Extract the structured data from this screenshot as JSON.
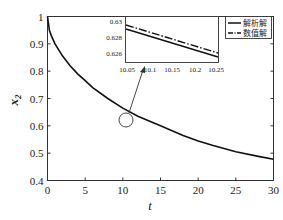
{
  "chart_data": {
    "type": "line",
    "title": "",
    "xlabel": "t",
    "ylabel": "x2",
    "xlim": [
      0,
      30
    ],
    "ylim": [
      0.4,
      1.0
    ],
    "xticks": [
      0,
      5,
      10,
      15,
      20,
      25,
      30
    ],
    "yticks": [
      0.4,
      0.5,
      0.6,
      0.7,
      0.8,
      0.9,
      1.0
    ],
    "ytick_labels": [
      "0.4",
      "0.5",
      "0.6",
      "0.7",
      "0.8",
      "0.9",
      "1"
    ],
    "grid": false,
    "legend_position": "upper right",
    "series": [
      {
        "name": "解析解",
        "style": "solid",
        "x": [
          0,
          0.25,
          0.5,
          1,
          2,
          3,
          4,
          5,
          6,
          8,
          10,
          12,
          15,
          18,
          20,
          22,
          25,
          28,
          30
        ],
        "y": [
          1.0,
          0.95,
          0.93,
          0.9,
          0.855,
          0.82,
          0.79,
          0.765,
          0.74,
          0.7,
          0.665,
          0.635,
          0.6,
          0.565,
          0.545,
          0.528,
          0.505,
          0.488,
          0.478
        ]
      },
      {
        "name": "数值解",
        "style": "dash-dot",
        "x": [
          0,
          0.25,
          0.5,
          1,
          2,
          3,
          4,
          5,
          6,
          8,
          10,
          12,
          15,
          18,
          20,
          22,
          25,
          28,
          30
        ],
        "y": [
          1.0,
          0.95,
          0.93,
          0.9,
          0.855,
          0.82,
          0.79,
          0.765,
          0.74,
          0.7,
          0.665,
          0.635,
          0.6,
          0.565,
          0.545,
          0.528,
          0.505,
          0.488,
          0.478
        ]
      }
    ],
    "inset": {
      "xlim": [
        10.05,
        10.25
      ],
      "ylim": [
        0.6255,
        0.6305
      ],
      "xticks": [
        "10.05",
        "10.1",
        "10.15",
        "10.2",
        "10.25"
      ],
      "yticks": [
        "0.63",
        "0.628",
        "0.626"
      ],
      "series": [
        {
          "name": "数值解",
          "style": "dash-dot",
          "x": [
            10.05,
            10.25
          ],
          "y": [
            0.6297,
            0.6261
          ]
        },
        {
          "name": "解析解",
          "style": "solid",
          "x": [
            10.05,
            10.25
          ],
          "y": [
            0.6291,
            0.6256
          ]
        }
      ],
      "zoom_marker": {
        "x": 10.6,
        "y": 0.622,
        "shape": "circle"
      }
    },
    "annotations": [
      "arrow from circled region near t≈10.6 to inset"
    ]
  }
}
